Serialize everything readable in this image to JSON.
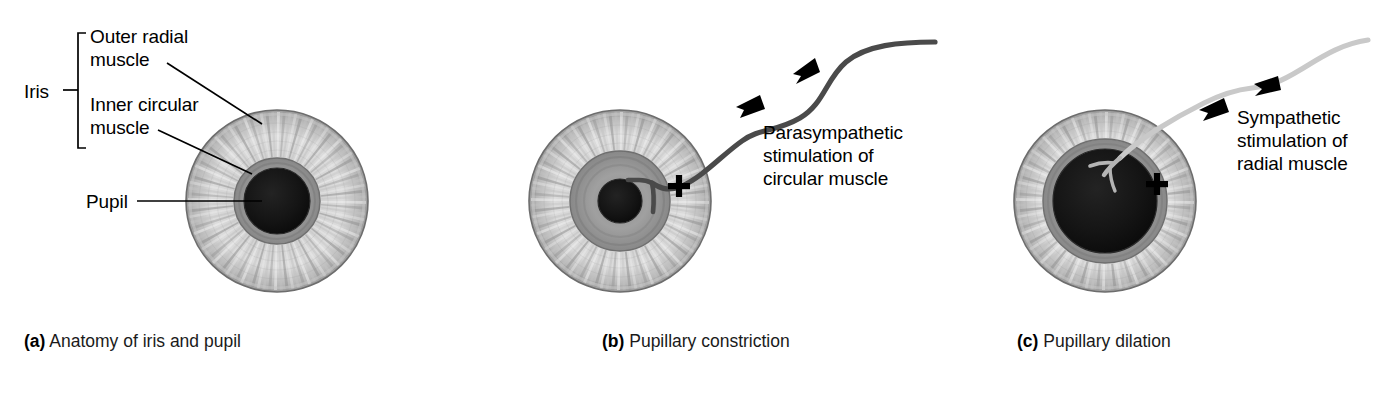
{
  "figure": {
    "background_color": "#ffffff"
  },
  "labels": {
    "iris": "Iris",
    "outer_radial_muscle": "Outer radial\nmuscle",
    "inner_circular_muscle": "Inner circular\nmuscle",
    "pupil": "Pupil",
    "parasympathetic": "Parasympathetic\nstimulation of\ncircular muscle",
    "sympathetic": "Sympathetic\nstimulation of\nradial muscle",
    "plus_sign_b": "+",
    "plus_sign_c": "+"
  },
  "captions": {
    "a": {
      "tag": "(a)",
      "text": " Anatomy of iris and pupil"
    },
    "b": {
      "tag": "(b)",
      "text": " Pupillary constriction"
    },
    "c": {
      "tag": "(c)",
      "text": " Pupillary dilation"
    }
  },
  "panels": [
    {
      "id": "a",
      "name": "anatomy-of-iris-and-pupil",
      "eye": {
        "cx": 277,
        "cy": 201,
        "iris_outer_radius": 91,
        "circular_muscle_outer_radius": 43,
        "pupil_radius": 33,
        "state": "neutral"
      }
    },
    {
      "id": "b",
      "name": "pupillary-constriction",
      "eye": {
        "cx": 620,
        "cy": 201,
        "iris_outer_radius": 91,
        "circular_muscle_outer_radius": 50,
        "pupil_radius": 22,
        "state": "constricted"
      },
      "nerve": {
        "type": "parasympathetic",
        "color": "#4a4a4a",
        "arrow_count": 2
      }
    },
    {
      "id": "c",
      "name": "pupillary-dilation",
      "eye": {
        "cx": 1105,
        "cy": 201,
        "iris_outer_radius": 91,
        "circular_muscle_outer_radius": 62,
        "pupil_radius": 52,
        "state": "dilated"
      },
      "nerve": {
        "type": "sympathetic",
        "color": "#c9c9c9",
        "arrow_count": 2
      }
    }
  ],
  "colors": {
    "pupil": "#141414",
    "iris_light": "#e2e2e2",
    "iris_mid": "#a8a8a8",
    "iris_dark": "#8a8a8a",
    "circular_muscle": "#909090",
    "outline": "#5a5a5a",
    "leader_line": "#000000",
    "parasympathetic_nerve": "#4a4a4a",
    "sympathetic_nerve": "#c9c9c9",
    "text": "#000000"
  }
}
